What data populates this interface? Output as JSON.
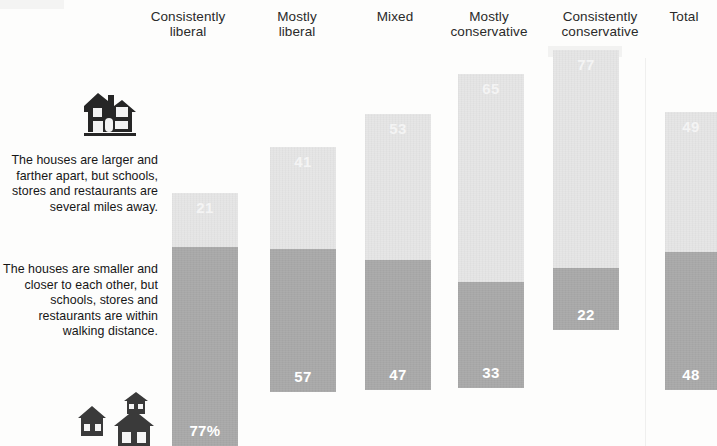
{
  "columns": [
    {
      "label": "Consistently\nliberal"
    },
    {
      "label": "Mostly\nliberal"
    },
    {
      "label": "Mixed"
    },
    {
      "label": "Mostly\nconservative"
    },
    {
      "label": "Consistently\nconservative"
    },
    {
      "label": "Total"
    }
  ],
  "side_labels": {
    "top": "The houses are larger and farther apart, but schools, stores and restaurants are several miles away.",
    "bottom": "The houses are smaller and closer to each other, but schools, stores and restaurants are within walking distance."
  },
  "icons": {
    "large_house": "house-icon",
    "small_houses": "houses-cluster-icon"
  },
  "colors": {
    "walkable_segment": "#a8a8a8",
    "spread_out_segment": "#e6e6e6",
    "value_label_on_dark": "#ffffff",
    "value_label_on_light": "#f4f4f4",
    "text": "#1a1a1a"
  },
  "bar_value_labels": [
    "77%",
    "57",
    "47",
    "33",
    "22",
    "48"
  ],
  "chart_data": {
    "type": "bar",
    "title": "",
    "subtitle": "",
    "xlabel": "",
    "ylabel": "",
    "stacked": true,
    "grid": false,
    "legend": "left-side-labels",
    "categories": [
      "Consistently liberal",
      "Mostly liberal",
      "Mixed",
      "Mostly conservative",
      "Consistently conservative",
      "Total"
    ],
    "series": [
      {
        "name": "The houses are smaller and closer to each other, but schools, stores and restaurants are within walking distance.",
        "color": "#a8a8a8",
        "values": [
          77,
          57,
          47,
          33,
          22,
          48
        ],
        "data_labels": [
          "77%",
          "57",
          "47",
          "33",
          "22",
          "48"
        ]
      },
      {
        "name": "The houses are larger and farther apart, but schools, stores and restaurants are several miles away.",
        "color": "#e6e6e6",
        "values": [
          21,
          41,
          53,
          65,
          77,
          49
        ],
        "data_labels": [
          "21",
          "41",
          "53",
          "65",
          "77",
          "49"
        ]
      }
    ],
    "ylim": [
      0,
      100
    ],
    "units": "percent"
  },
  "bars": [
    {
      "name": "consistently-liberal",
      "left": 172,
      "width": 66,
      "top": 193,
      "dark": 77,
      "light": 21,
      "dark_label": "77%",
      "light_label": "21"
    },
    {
      "name": "mostly-liberal",
      "left": 270,
      "width": 66,
      "top": 147,
      "dark": 57,
      "light": 41,
      "dark_label": "57",
      "light_label": "41"
    },
    {
      "name": "mixed",
      "left": 365,
      "width": 66,
      "top": 114,
      "dark": 47,
      "light": 53,
      "dark_label": "47",
      "light_label": "53"
    },
    {
      "name": "mostly-conservative",
      "left": 458,
      "width": 66,
      "top": 74,
      "dark": 33,
      "light": 65,
      "dark_label": "33",
      "light_label": "65"
    },
    {
      "name": "consistently-conservative",
      "left": 553,
      "width": 66,
      "top": 50,
      "dark": 22,
      "light": 77,
      "dark_label": "22",
      "light_label": "77"
    },
    {
      "name": "total",
      "left": 665,
      "width": 52,
      "top": 112,
      "dark": 48,
      "light": 49,
      "dark_label": "48",
      "light_label": "49"
    }
  ],
  "bar_bottoms": [
    446,
    392,
    390,
    388,
    330,
    390
  ],
  "header_positions": [
    {
      "left": 140,
      "top": 10,
      "width": 96
    },
    {
      "left": 256,
      "top": 10,
      "width": 82
    },
    {
      "left": 352,
      "top": 10,
      "width": 86
    },
    {
      "left": 434,
      "top": 10,
      "width": 110
    },
    {
      "left": 540,
      "top": 10,
      "width": 120
    },
    {
      "left": 654,
      "top": 10,
      "width": 60
    }
  ]
}
